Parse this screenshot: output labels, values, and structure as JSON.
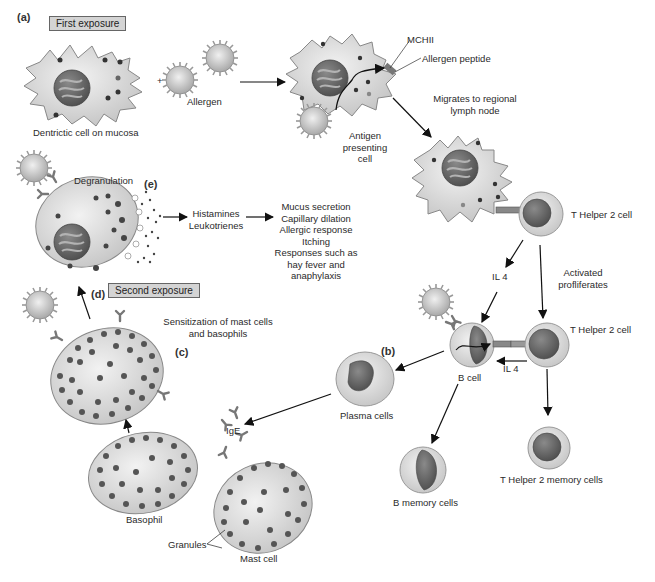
{
  "diagram": {
    "panels": {
      "a": "(a)",
      "b": "(b)",
      "c": "(c)",
      "d": "(d)",
      "e": "(e)"
    },
    "badges": {
      "first_exposure": "First exposure",
      "second_exposure": "Second exposure"
    },
    "labels": {
      "dendritic_cell": "Dentrictic cell on mucosa",
      "allergen": "Allergen",
      "plus": "+",
      "mchii": "MCHII",
      "allergen_peptide": "Allergen peptide",
      "migrates": [
        "Migrates to regional",
        "lymph node"
      ],
      "apc": [
        "Antigen",
        "presenting",
        "cell"
      ],
      "th2_cell_1": "T Helper 2 cell",
      "il4_1": "IL 4",
      "activated": [
        "Activated",
        "profliferates"
      ],
      "th2_cell_2": "T Helper 2 cell",
      "il4_2": "IL 4",
      "b_cell": "B cell",
      "plasma_cells": "Plasma cells",
      "b_memory": "B memory cells",
      "th2_memory": "T Helper 2 memory cells",
      "ige": "IgE",
      "basophil": "Basophil",
      "granules": "Granules",
      "mast_cell": "Mast cell",
      "sensitization": [
        "Sensitization of mast cells",
        "and basophils"
      ],
      "degranulation": "Degranulation",
      "mediators": [
        "Histamines",
        "Leukotrienes"
      ],
      "effects": [
        "Mucus secretion",
        "Capillary dilation",
        "Allergic response",
        "Itching",
        "Responses such as",
        "hay fever and",
        "anaphylaxis"
      ]
    },
    "colors": {
      "cell_body": "#d9d9d9",
      "cell_outline": "#8c8c8c",
      "nucleus": "#6e6e6e",
      "granule": "#4a4a4a",
      "badge_bg": "#d4d4d4",
      "arrow": "#111111"
    }
  }
}
